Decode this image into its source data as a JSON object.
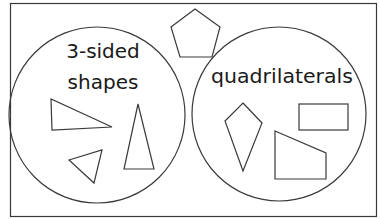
{
  "diagram": {
    "type": "venn-sort",
    "stroke_color": "#3a3a3a",
    "background": "#ffffff",
    "sets": [
      {
        "id": "three-sided",
        "label_line1": "3-sided",
        "label_line2": "shapes",
        "members": [
          "right-triangle",
          "small-triangle",
          "tall-isosceles-triangle"
        ]
      },
      {
        "id": "quadrilaterals",
        "label_line1": "quadrilaterals",
        "members": [
          "kite",
          "rectangle",
          "right-trapezoid"
        ]
      }
    ],
    "outside": [
      "pentagon"
    ]
  }
}
